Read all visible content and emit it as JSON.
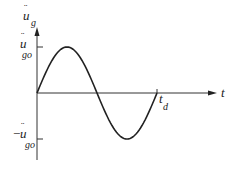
{
  "diagram": {
    "type": "half-sine-cycle ground acceleration pulse",
    "y_axis": {
      "symbol": "u",
      "dots": "¨",
      "subscript": "g"
    },
    "x_axis": {
      "symbol": "t"
    },
    "positive_peak": {
      "prefix": "",
      "symbol": "u",
      "dots": "¨",
      "subscript": "go"
    },
    "negative_peak": {
      "prefix": "−",
      "symbol": "u",
      "dots": "¨",
      "subscript": "go"
    },
    "duration": {
      "symbol": "t",
      "subscript": "d"
    },
    "curve": {
      "function": "sin",
      "cycles": 1,
      "amplitude": 1
    }
  }
}
